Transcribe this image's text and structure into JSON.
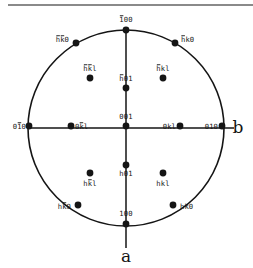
{
  "figure": {
    "kind": "stereographic-projection",
    "axis_labels": {
      "horizontal_right": "b",
      "vertical_bottom": "a"
    },
    "geometry": {
      "center_x": 126,
      "center_y": 128,
      "radius": 98
    },
    "colors": {
      "ink": "#151515",
      "rule": "#8a8a8a",
      "background": "#ffffff"
    }
  },
  "chart_data": {
    "type": "scatter",
    "title": "",
    "xlabel": "b",
    "ylabel": "a",
    "grid": false,
    "legend": false,
    "projection": "stereographic",
    "circle": {
      "cx": 126,
      "cy": 128,
      "r": 98
    },
    "axes": [
      {
        "name": "b-axis",
        "orientation": "horizontal",
        "label": "b",
        "label_side": "right"
      },
      {
        "name": "a-axis",
        "orientation": "vertical",
        "label": "a",
        "label_side": "bottom"
      }
    ],
    "points": [
      {
        "id": "p-1bar00",
        "label": "100",
        "bars": [
          0
        ],
        "x": 126,
        "y": 30,
        "tx": 126,
        "ty": 22,
        "anchor": "middle",
        "ring": "primitive",
        "note": "top of circle, -a direction"
      },
      {
        "id": "p-hbarkbar0",
        "label": "hk0",
        "bars": [
          0,
          1
        ],
        "x": 76,
        "y": 43,
        "tx": 69,
        "ty": 42,
        "anchor": "end",
        "ring": "primitive"
      },
      {
        "id": "p-hbark0",
        "label": "hk0",
        "bars": [
          0
        ],
        "x": 175,
        "y": 43,
        "tx": 181,
        "ty": 42,
        "anchor": "start",
        "ring": "primitive"
      },
      {
        "id": "p-hbarkbarl",
        "label": "hkl",
        "bars": [
          0,
          1
        ],
        "x": 90,
        "y": 78,
        "tx": 90,
        "ty": 71,
        "anchor": "middle",
        "ring": "upper"
      },
      {
        "id": "p-hbarkl",
        "label": "hkl",
        "bars": [
          0
        ],
        "x": 163,
        "y": 78,
        "tx": 163,
        "ty": 71,
        "anchor": "middle",
        "ring": "upper"
      },
      {
        "id": "p-hbar01",
        "label": "h01",
        "bars": [
          0
        ],
        "x": 126,
        "y": 88,
        "tx": 126,
        "ty": 81,
        "anchor": "middle",
        "ring": "upper"
      },
      {
        "id": "p-001",
        "label": "001",
        "bars": [],
        "x": 126,
        "y": 126,
        "tx": 126,
        "ty": 119,
        "anchor": "middle",
        "ring": "center"
      },
      {
        "id": "p-01bar0",
        "label": "010",
        "bars": [
          1
        ],
        "x": 29,
        "y": 126,
        "tx": 26,
        "ty": 129,
        "anchor": "end",
        "ring": "primitive"
      },
      {
        "id": "p-0kbarl",
        "label": "0kl",
        "bars": [
          1
        ],
        "x": 71,
        "y": 126,
        "tx": 75,
        "ty": 129,
        "anchor": "start",
        "ring": "left"
      },
      {
        "id": "p-0kl",
        "label": "0kl",
        "bars": [],
        "x": 180,
        "y": 126,
        "tx": 176,
        "ty": 129,
        "anchor": "end",
        "ring": "right"
      },
      {
        "id": "p-010",
        "label": "010",
        "bars": [],
        "x": 222,
        "y": 126,
        "tx": 218,
        "ty": 129,
        "anchor": "end",
        "ring": "primitive"
      },
      {
        "id": "p-h01",
        "label": "h01",
        "bars": [],
        "x": 126,
        "y": 165,
        "tx": 126,
        "ty": 176,
        "anchor": "middle",
        "ring": "lower"
      },
      {
        "id": "p-hkbarl",
        "label": "hkl",
        "bars": [
          1
        ],
        "x": 90,
        "y": 173,
        "tx": 90,
        "ty": 186,
        "anchor": "middle",
        "ring": "lower"
      },
      {
        "id": "p-hkl",
        "label": "hkl",
        "bars": [],
        "x": 163,
        "y": 173,
        "tx": 163,
        "ty": 186,
        "anchor": "middle",
        "ring": "lower"
      },
      {
        "id": "p-hkbar0",
        "label": "hk0",
        "bars": [
          1
        ],
        "x": 78,
        "y": 205,
        "tx": 71,
        "ty": 209,
        "anchor": "end",
        "ring": "primitive"
      },
      {
        "id": "p-hk0",
        "label": "hk0",
        "bars": [],
        "x": 173,
        "y": 205,
        "tx": 180,
        "ty": 209,
        "anchor": "start",
        "ring": "primitive"
      },
      {
        "id": "p-100",
        "label": "100",
        "bars": [],
        "x": 126,
        "y": 224,
        "tx": 126,
        "ty": 216,
        "anchor": "middle",
        "ring": "primitive",
        "note": "bottom of circle, +a direction"
      }
    ]
  }
}
